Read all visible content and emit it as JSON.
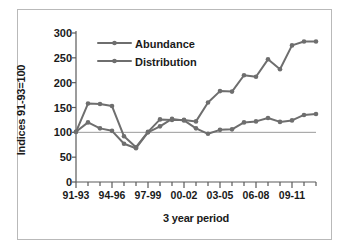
{
  "chart_data": {
    "type": "line",
    "title": "",
    "xlabel": "3 year period",
    "ylabel": "Indices 91-93=100",
    "ylim": [
      0,
      300
    ],
    "yticks": [
      0,
      50,
      100,
      150,
      200,
      250,
      300
    ],
    "ytick_labels": [
      "0",
      "50",
      "100",
      "150",
      "200",
      "250",
      "300"
    ],
    "grid": false,
    "legend_position": "upper-left",
    "baseline": 100,
    "x": [
      "91-93",
      "92-94",
      "93-95",
      "94-96",
      "95-97",
      "96-98",
      "97-99",
      "98-00",
      "99-01",
      "00-02",
      "01-03",
      "02-04",
      "03-05",
      "04-06",
      "05-07",
      "06-08",
      "07-09",
      "08-10",
      "09-11",
      "10-12",
      "11-13"
    ],
    "xtick_labels": [
      "91-93",
      "94-96",
      "97-99",
      "00-02",
      "03-05",
      "06-08",
      "09-11"
    ],
    "xtick_indices": [
      0,
      3,
      6,
      9,
      12,
      15,
      18
    ],
    "series": [
      {
        "name": "Abundance",
        "color": "#6e6e6e",
        "values": [
          101,
          158,
          157,
          153,
          92,
          70,
          101,
          126,
          125,
          125,
          122,
          160,
          183,
          182,
          215,
          212,
          247,
          227,
          275,
          283,
          283
        ]
      },
      {
        "name": "Distribution",
        "color": "#6e6e6e",
        "values": [
          101,
          120,
          108,
          103,
          77,
          68,
          100,
          112,
          127,
          124,
          108,
          97,
          105,
          106,
          120,
          122,
          129,
          121,
          124,
          135,
          137
        ]
      }
    ]
  },
  "legend": {
    "items": [
      {
        "label": "Abundance"
      },
      {
        "label": "Distribution"
      }
    ]
  },
  "colors": {
    "line": "#6e6e6e",
    "axis": "#5a5a5a",
    "baseline": "#9a9a9a",
    "frame": "#b9b9b9",
    "text": "#1a1a1a"
  }
}
